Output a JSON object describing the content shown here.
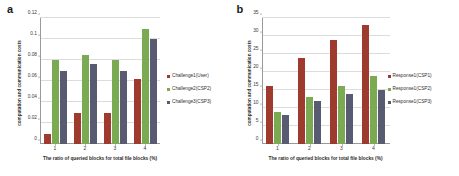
{
  "figure": {
    "background": "#ffffff",
    "panels": [
      {
        "letter": "a",
        "ylabel": "computation and communication costs",
        "xlabel": "The ratio of queried blocks for total file blocks (%)",
        "legend": [
          {
            "label": "Challenge1(User)",
            "color": "#9E3B2E"
          },
          {
            "label": "Challenge2(CSP2)",
            "color": "#7AAB52"
          },
          {
            "label": "Challenge3(CSP3)",
            "color": "#595B73"
          }
        ]
      },
      {
        "letter": "b",
        "ylabel": "computation and communication costs",
        "xlabel": "The ratio of queried blocks for total file blocks (%)",
        "legend": [
          {
            "label": "Response1(CSP1)",
            "color": "#9E3B2E"
          },
          {
            "label": "Response1(CSP2)",
            "color": "#7AAB52"
          },
          {
            "label": "Response1(CSP3)",
            "color": "#595B73"
          }
        ]
      }
    ]
  },
  "chart_data": [
    {
      "type": "bar",
      "panel": "a",
      "title": "",
      "xlabel": "The ratio of queried blocks for total file blocks (%)",
      "ylabel": "computation and communication costs",
      "categories": [
        "1",
        "2",
        "3",
        "4"
      ],
      "yticks": [
        "0",
        "0.02",
        "0.04",
        "0.06",
        "0.08",
        "0.1",
        "0.12"
      ],
      "ytick_values": [
        0,
        0.02,
        0.04,
        0.06,
        0.08,
        0.1,
        0.12
      ],
      "ylim": [
        0,
        0.12
      ],
      "grid": true,
      "legend_position": "right",
      "series": [
        {
          "name": "Challenge1(User)",
          "color": "#9E3B2E",
          "values": [
            0.01,
            0.03,
            0.03,
            0.062
          ]
        },
        {
          "name": "Challenge2(CSP2)",
          "color": "#7AAB52",
          "values": [
            0.08,
            0.085,
            0.08,
            0.11
          ]
        },
        {
          "name": "Challenge3(CSP3)",
          "color": "#595B73",
          "values": [
            0.07,
            0.076,
            0.07,
            0.1
          ]
        }
      ]
    },
    {
      "type": "bar",
      "panel": "b",
      "title": "",
      "xlabel": "The ratio of queried blocks for total file blocks (%)",
      "ylabel": "computation and communication costs",
      "categories": [
        "1",
        "2",
        "3",
        "4"
      ],
      "yticks": [
        "0",
        "5",
        "10",
        "15",
        "20",
        "25",
        "30",
        "35"
      ],
      "ytick_values": [
        0,
        5,
        10,
        15,
        20,
        25,
        30,
        35
      ],
      "ylim": [
        0,
        35
      ],
      "grid": true,
      "legend_position": "right",
      "series": [
        {
          "name": "Response1(CSP1)",
          "color": "#9E3B2E",
          "values": [
            16,
            24,
            29,
            33
          ]
        },
        {
          "name": "Response1(CSP2)",
          "color": "#7AAB52",
          "values": [
            9,
            13,
            16,
            19
          ]
        },
        {
          "name": "Response1(CSP3)",
          "color": "#595B73",
          "values": [
            8,
            12,
            14,
            15
          ]
        }
      ]
    }
  ]
}
